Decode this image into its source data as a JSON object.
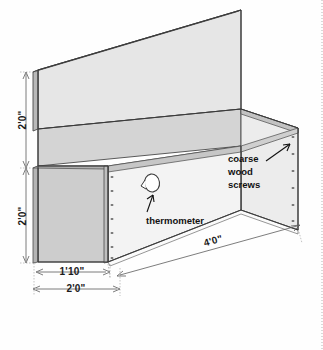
{
  "dimensions": [
    {
      "id": "back-panel-height",
      "label": "2'0\"",
      "orientation": "vertical",
      "position": "left-upper"
    },
    {
      "id": "box-height",
      "label": "2'0\"",
      "orientation": "vertical",
      "position": "left-lower"
    },
    {
      "id": "inner-width",
      "label": "1'10\"",
      "orientation": "horizontal",
      "position": "bottom-upper"
    },
    {
      "id": "outer-width",
      "label": "2'0\"",
      "orientation": "horizontal",
      "position": "bottom-lower"
    },
    {
      "id": "length",
      "label": "4'0\"",
      "orientation": "diagonal",
      "position": "bottom-right"
    }
  ],
  "annotations": [
    {
      "id": "coarse-wood-screws",
      "lines": [
        "coarse",
        "wood",
        "screws"
      ],
      "target": "screw column on right end panel"
    },
    {
      "id": "thermometer",
      "lines": [
        "thermometer"
      ],
      "target": "circular hole on front panel"
    }
  ],
  "parts": {
    "back_panel": {
      "name": "back panel",
      "fill": "#e4e4e4"
    },
    "front_panel": {
      "name": "front panel",
      "fill": "#f4f4f4"
    },
    "left_end_panel": {
      "name": "left end panel",
      "fill": "#cfcfcf"
    },
    "right_end_panel": {
      "name": "right end panel",
      "fill": "#ededed"
    },
    "inner_back_face": {
      "name": "inner back face",
      "fill": "#d6d6d6"
    },
    "top_edge_band": {
      "name": "top edge band",
      "fill": "#bdbdbd"
    },
    "thermometer_hole": {
      "name": "thermometer hole",
      "fill": "#ffffff"
    }
  },
  "colors": {
    "outline": "#4a4a4a",
    "outline_dark": "#3a3a3a",
    "dimension_line": "#5c5c5c",
    "extension_line": "#9a9a9a",
    "leader": "#111111",
    "text": "#1b1b1b",
    "background": "#fefefe",
    "screw": "#6e6e6e"
  },
  "screws": {
    "left_column_count": 7,
    "right_column_count": 6,
    "label": "screw"
  }
}
